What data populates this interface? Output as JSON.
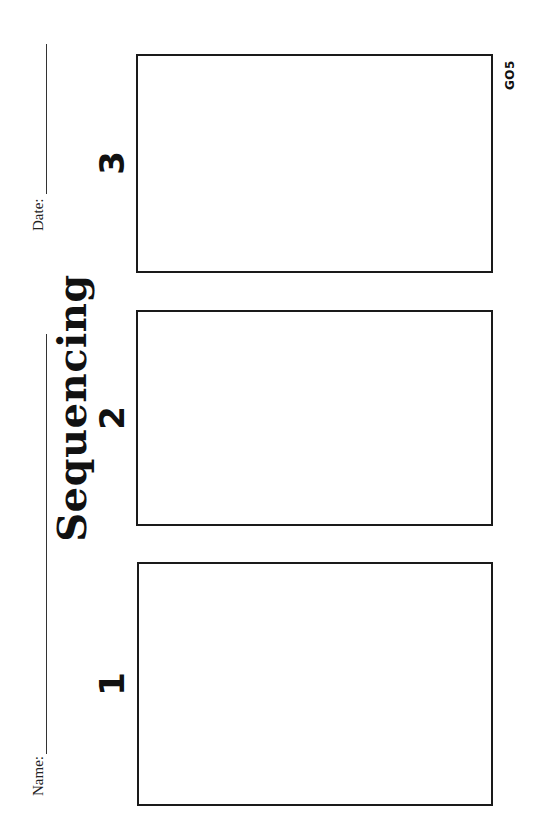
{
  "worksheet": {
    "title": "Sequencing",
    "code": "GO5",
    "header": {
      "name_label": "Name:",
      "date_label": "Date:"
    },
    "boxes": [
      {
        "number": "1"
      },
      {
        "number": "2"
      },
      {
        "number": "3"
      }
    ],
    "colors": {
      "ink": "#111111",
      "background": "#ffffff"
    }
  }
}
